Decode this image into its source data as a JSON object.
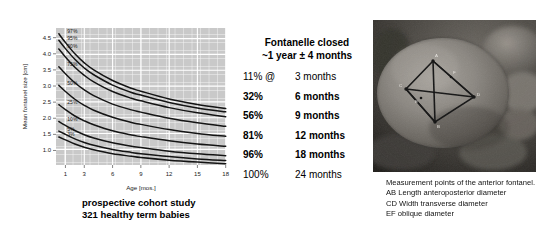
{
  "chart_data": {
    "type": "line",
    "title": "",
    "xlabel": "Age [mos.]",
    "ylabel": "Mean fontanel size [cm]",
    "xlim": [
      0,
      18
    ],
    "ylim": [
      0.55,
      4.8
    ],
    "xticks": [
      1,
      3,
      6,
      9,
      12,
      15,
      18
    ],
    "yticks": [
      1.0,
      1.5,
      2.0,
      2.5,
      3.0,
      3.5,
      4.0,
      4.5
    ],
    "grid": true,
    "legend": "inline-curve-labels",
    "x": [
      0.3,
      1,
      2,
      3,
      4,
      6,
      8,
      9,
      12,
      15,
      18
    ],
    "series": [
      {
        "name": "97%",
        "values": [
          4.62,
          4.35,
          4.0,
          3.72,
          3.5,
          3.17,
          2.93,
          2.84,
          2.6,
          2.43,
          2.3
        ]
      },
      {
        "name": "95%",
        "values": [
          4.42,
          4.16,
          3.83,
          3.56,
          3.35,
          3.03,
          2.8,
          2.72,
          2.49,
          2.32,
          2.2
        ]
      },
      {
        "name": "90%",
        "values": [
          4.15,
          3.9,
          3.58,
          3.33,
          3.13,
          2.83,
          2.62,
          2.54,
          2.33,
          2.17,
          2.05
        ]
      },
      {
        "name": "75%",
        "values": [
          3.6,
          3.38,
          3.1,
          2.88,
          2.7,
          2.44,
          2.26,
          2.19,
          2.0,
          1.86,
          1.75
        ]
      },
      {
        "name": "50%",
        "values": [
          3.02,
          2.83,
          2.59,
          2.4,
          2.25,
          2.03,
          1.87,
          1.81,
          1.65,
          1.53,
          1.44
        ]
      },
      {
        "name": "25%",
        "values": [
          2.42,
          2.27,
          2.07,
          1.92,
          1.8,
          1.61,
          1.48,
          1.43,
          1.3,
          1.2,
          1.13
        ]
      },
      {
        "name": "10%",
        "values": [
          1.9,
          1.78,
          1.62,
          1.49,
          1.39,
          1.24,
          1.13,
          1.09,
          0.98,
          0.9,
          0.84
        ]
      },
      {
        "name": "5%",
        "values": [
          1.6,
          1.5,
          1.36,
          1.25,
          1.16,
          1.03,
          0.94,
          0.9,
          0.81,
          0.74,
          0.69
        ]
      },
      {
        "name": "3%",
        "values": [
          1.42,
          1.33,
          1.2,
          1.1,
          1.02,
          0.9,
          0.82,
          0.78,
          0.7,
          0.64,
          0.59
        ]
      }
    ],
    "curve_labels": [
      "97%",
      "95%",
      "90%",
      "75%",
      "50%",
      "25%",
      "10%",
      "5%",
      "3%"
    ],
    "colors": {
      "plot_background": "#c9c9c9",
      "gridline": "#ffffff",
      "curve": "#111111"
    }
  },
  "left_caption": {
    "line1": "prospective cohort study",
    "line2": "321 healthy term babies"
  },
  "center_panel": {
    "title_line1": "Fontanelle closed",
    "title_line2": "~1 year ± 4 months",
    "rows": [
      {
        "percent": "11% @",
        "age": "3 months",
        "bold": false
      },
      {
        "percent": "32%",
        "age": "6 months",
        "bold": true
      },
      {
        "percent": "56%",
        "age": "9 months",
        "bold": true
      },
      {
        "percent": "81%",
        "age": "12 months",
        "bold": true
      },
      {
        "percent": "96%",
        "age": "18 months",
        "bold": true
      },
      {
        "percent": "100%",
        "age": "24 months",
        "bold": false
      }
    ]
  },
  "photo": {
    "alt": "Infant head with anterior fontanelle measurement points marked",
    "point_labels": [
      "A",
      "B",
      "C",
      "D",
      "E",
      "F"
    ]
  },
  "right_caption": {
    "line1": "Measurement points of the anterior fontanel.",
    "line2": "AB Length anteroposterior diameter",
    "line3": "CD Width transverse diameter",
    "line4": "EF oblique diameter"
  }
}
